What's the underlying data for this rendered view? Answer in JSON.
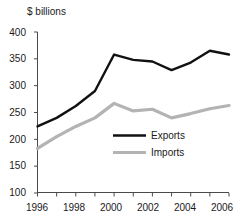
{
  "chart_data": {
    "type": "line",
    "title": "",
    "subtitle": "",
    "xlabel": "",
    "ylabel": "$ billions",
    "ylim": [
      100,
      400
    ],
    "xlim": [
      1996,
      2006
    ],
    "yticks": [
      100,
      150,
      200,
      250,
      300,
      350,
      400
    ],
    "ytick_labels": [
      "100",
      "150",
      "200",
      "250",
      "300",
      "350",
      "400"
    ],
    "x": [
      1996,
      1997,
      1998,
      1999,
      2000,
      2001,
      2002,
      2003,
      2004,
      2005,
      2006
    ],
    "xticks": [
      1996,
      1997,
      1998,
      1999,
      2000,
      2001,
      2002,
      2003,
      2004,
      2005,
      2006
    ],
    "xtick_labels": [
      "1996",
      "",
      "1998",
      "",
      "2000",
      "",
      "2002",
      "",
      "2004",
      "",
      "2006"
    ],
    "xtick_labels_shown": [
      "1996",
      "1998",
      "2000",
      "2002",
      "2004",
      "2006"
    ],
    "grid": false,
    "legend_position": "inside-center-left",
    "series": [
      {
        "name": "Exports",
        "color": "#111111",
        "values": [
          224,
          240,
          262,
          290,
          358,
          348,
          345,
          329,
          343,
          365,
          358
        ]
      },
      {
        "name": "Imports",
        "color": "#b3b3b3",
        "values": [
          183,
          205,
          224,
          240,
          267,
          253,
          256,
          240,
          248,
          257,
          263
        ]
      }
    ]
  },
  "legend": {
    "items": [
      {
        "label": "Exports"
      },
      {
        "label": "Imports"
      }
    ]
  },
  "colors": {
    "exports": "#111111",
    "imports": "#b3b3b3",
    "axis": "#4a4a4a",
    "background": "#ffffff"
  }
}
